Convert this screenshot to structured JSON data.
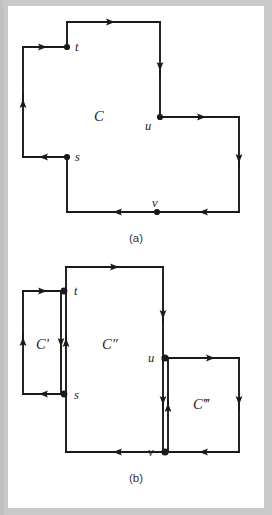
{
  "figure": {
    "background_color": "#ffffff",
    "page_color": "#c9c9c9",
    "stroke_color": "#1a1a1a",
    "panels": [
      {
        "id": "panel-a",
        "caption": "(a)",
        "region_labels": [
          {
            "name": "region-label-c",
            "text": "C",
            "x": 92,
            "y": 110
          }
        ],
        "vertices": [
          {
            "name": "vertex-t",
            "label": "t",
            "x": 67,
            "y": 47
          },
          {
            "name": "vertex-u",
            "label": "u",
            "x": 160,
            "y": 117
          },
          {
            "name": "vertex-s",
            "label": "s",
            "x": 67,
            "y": 157
          },
          {
            "name": "vertex-v",
            "label": "v",
            "x": 157,
            "y": 212
          }
        ]
      },
      {
        "id": "panel-b",
        "caption": "(b)",
        "region_labels": [
          {
            "name": "region-label-c-prime",
            "text": "C'",
            "x": 44,
            "y": 345
          },
          {
            "name": "region-label-c-double-prime",
            "text": "C″",
            "x": 110,
            "y": 345
          },
          {
            "name": "region-label-c-triple-prime",
            "text": "C‴",
            "x": 206,
            "y": 405
          }
        ],
        "vertices": [
          {
            "name": "vertex-t",
            "label": "t",
            "x": 66,
            "y": 291
          },
          {
            "name": "vertex-s",
            "label": "s",
            "x": 66,
            "y": 394
          },
          {
            "name": "vertex-u",
            "label": "u",
            "x": 163,
            "y": 358
          },
          {
            "name": "vertex-v",
            "label": "v",
            "x": 163,
            "y": 452
          }
        ]
      }
    ]
  },
  "captions": {
    "panel_a": "(a)",
    "panel_b": "(b)"
  },
  "labels": {
    "t": "t",
    "s": "s",
    "u": "u",
    "v": "v",
    "C": "C",
    "C_prime": "C'",
    "C_double_prime": "C″",
    "C_triple_prime": "C‴"
  }
}
